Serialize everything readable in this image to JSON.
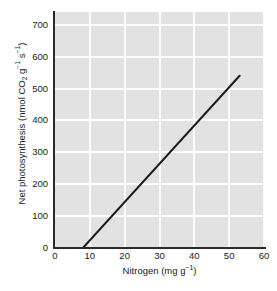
{
  "chart_data": {
    "type": "line",
    "title": "",
    "subtitle": "",
    "xlabel_parts": {
      "name": "Nitrogen (mg g",
      "exponent": "−1",
      "close": ")"
    },
    "xlabel": "Nitrogen (mg g⁻¹)",
    "ylabel": "Net photosynthesis (nmol CO₂ g⁻¹ s⁻¹)",
    "ylabel_parts": {
      "lead": "Net photosynthesis (nmol CO",
      "sub2": "2",
      "mid": " g",
      "exp1": "−1",
      "mid2": " s",
      "exp2": "−1",
      "close": ")"
    },
    "xlim": [
      0,
      60
    ],
    "ylim": [
      0,
      740
    ],
    "xticks": [
      0,
      10,
      20,
      30,
      40,
      50,
      60
    ],
    "xtick_labels": [
      "0",
      "10",
      "20",
      "30",
      "40",
      "50",
      "60"
    ],
    "yticks": [
      0,
      100,
      200,
      300,
      400,
      500,
      600,
      700
    ],
    "ytick_labels": [
      "0",
      "100",
      "200",
      "300",
      "400",
      "500",
      "600",
      "700"
    ],
    "grid": true,
    "grid_color": "#fcfcfc",
    "plot_background": "#e2e2e2",
    "axis_color": "#2b2b2b",
    "legend": null,
    "legend_position": "none",
    "series": [
      {
        "name": "regression",
        "style": "solid-line",
        "color": "#1c1c1c",
        "linewidth": 2,
        "x": [
          8,
          53
        ],
        "values": [
          0,
          540
        ]
      }
    ],
    "annotations": []
  },
  "figure": {
    "background": "#ffffff",
    "width": 277,
    "height": 291
  }
}
